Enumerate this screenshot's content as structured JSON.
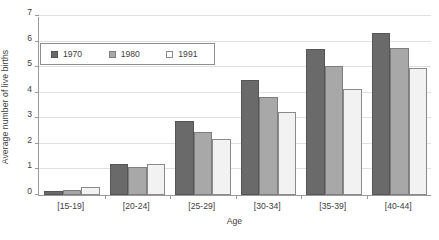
{
  "chart_data": {
    "type": "bar",
    "title": "",
    "subtitle": "",
    "xlabel": "Age",
    "ylabel": "Average number of live births",
    "categories": [
      "[15-19]",
      "[20-24]",
      "[25-29]",
      "[30-34]",
      "[35-39]",
      "[40-44]"
    ],
    "series": [
      {
        "name": "1970",
        "color": "#6a6a6a",
        "values": [
          0.15,
          1.2,
          2.9,
          4.5,
          5.7,
          6.35
        ]
      },
      {
        "name": "1980",
        "color": "#a8a8a8",
        "values": [
          0.2,
          1.1,
          2.45,
          3.85,
          5.05,
          5.75
        ]
      },
      {
        "name": "1991",
        "color": "#f2f2f2",
        "values": [
          0.3,
          1.2,
          2.2,
          3.25,
          4.15,
          4.95
        ]
      }
    ],
    "ylim": [
      0,
      7
    ],
    "yticks": [
      0,
      1,
      2,
      3,
      4,
      5,
      6,
      7
    ],
    "ytick_labels": [
      "0",
      "1",
      "2",
      "3",
      "4",
      "5",
      "6",
      "7"
    ],
    "grid": "horizontal",
    "legend_position": "upper-left-inside",
    "legend_entries": [
      "1970",
      "1980",
      "1991"
    ]
  },
  "legend": {
    "entries": [
      {
        "label": "1970",
        "swatch": "filled-dark-square-icon"
      },
      {
        "label": "1980",
        "swatch": "filled-gray-square-icon"
      },
      {
        "label": "1991",
        "swatch": "outlined-white-square-icon"
      }
    ]
  },
  "caption": {
    "clipped_text": ""
  }
}
